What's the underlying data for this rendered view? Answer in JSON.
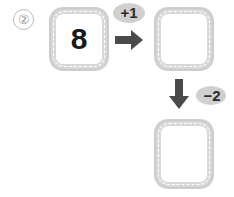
{
  "problem": {
    "number_label": "②"
  },
  "diagram": {
    "type": "function-machine",
    "boxes": [
      {
        "id": "input",
        "value": "8",
        "filled": true
      },
      {
        "id": "middle",
        "value": "",
        "filled": false
      },
      {
        "id": "output",
        "value": "",
        "filled": false
      }
    ],
    "operations": [
      {
        "id": "plus-one",
        "label": "+1",
        "direction": "right"
      },
      {
        "id": "minus-two",
        "label": "−2",
        "direction": "down"
      }
    ]
  },
  "colors": {
    "box_border": "#d8d8d8",
    "box_fill": "#ffffff",
    "badge_fill": "#d0d0d0",
    "arrow_fill": "#4a4a4a",
    "text": "#1a1a1a",
    "item_number": "#9a9a9a"
  },
  "icons": {
    "arrow_right": "arrow-right-icon",
    "arrow_down": "arrow-down-icon"
  }
}
